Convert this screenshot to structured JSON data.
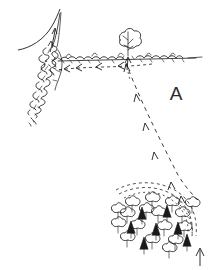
{
  "figure": {
    "type": "hand-drawn field sketch",
    "background_color": "#ffffff",
    "ink_color": "#1a1a1a",
    "width": 218,
    "height": 270,
    "labels": [
      {
        "id": "A",
        "text": "A",
        "x": 176,
        "y": 100,
        "font_size": 19
      }
    ],
    "features": {
      "horizontal_hedgerow": {
        "name": "horizontal hedgerow",
        "y": 58,
        "x_start": 52,
        "x_end": 200,
        "tail_line_to_x": 202
      },
      "vertical_hedgerow": {
        "name": "vertical hedgerow",
        "x_top": 56,
        "y_top": 46,
        "x_bottom": 30,
        "y_bottom": 124
      },
      "boundary_curve": {
        "name": "curved field boundary",
        "from_x": 20,
        "from_y": 50,
        "to_x": 62,
        "to_y": 10
      },
      "lone_tree": {
        "name": "lone tree on hedgerow",
        "x": 128,
        "y": 44,
        "crown_radius": 11
      },
      "woodland": {
        "name": "woodland copse",
        "center_x": 162,
        "center_y": 222,
        "deciduous_count": 17,
        "conifer_count": 7,
        "arc_count": 4
      }
    },
    "movement_lines": [
      {
        "name": "main dashed route",
        "style": "dashed",
        "from_x": 126,
        "from_y": 62,
        "to_x": 196,
        "to_y": 198,
        "arrow_count": 6,
        "arrow_direction": "up-left toward hedgerow"
      },
      {
        "name": "hedgerow dashed route",
        "style": "dashed",
        "from_x": 150,
        "from_y": 64,
        "to_x": 54,
        "to_y": 68,
        "arrow_count": 4,
        "arrow_direction": "left along hedgerow"
      },
      {
        "name": "hedge gap arrow",
        "style": "solid",
        "x": 54,
        "y": 50,
        "arrow_direction": "up-left through gap"
      },
      {
        "name": "tree approach arrow",
        "style": "solid",
        "x": 128,
        "y": 64,
        "arrow_direction": "up to tree"
      },
      {
        "name": "wood entry arrow",
        "style": "solid",
        "x": 200,
        "y": 258,
        "arrow_direction": "up into wood"
      }
    ]
  }
}
